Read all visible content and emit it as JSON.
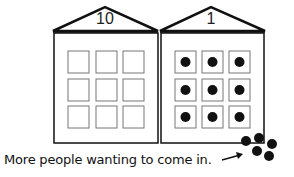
{
  "buildings": [
    {
      "label": "10",
      "windows": 9,
      "occupied": 0
    },
    {
      "label": "1",
      "windows": 9,
      "occupied": 9
    }
  ],
  "caption": "More people wanting to come in.",
  "waiting_people": 5,
  "colors": {
    "stroke": "#111111",
    "window_stroke": "#777777",
    "dot": "#111111"
  }
}
